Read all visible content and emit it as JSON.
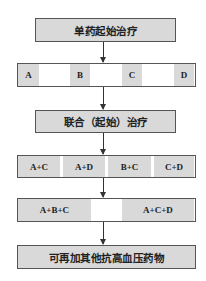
{
  "diagram": {
    "type": "flowchart",
    "direction": "top-to-bottom",
    "colors": {
      "box_fill": "#d9d9d9",
      "border": "#555555",
      "background": "#ffffff",
      "arrow": "#333333"
    },
    "nodes": [
      {
        "id": "mono",
        "label": "单药起始治疗"
      },
      {
        "id": "single-drugs",
        "cells": [
          "A",
          "B",
          "C",
          "D"
        ]
      },
      {
        "id": "combo",
        "label": "联合（起始）治疗"
      },
      {
        "id": "dual-drugs",
        "cells": [
          "A+C",
          "A+D",
          "B+C",
          "C+D"
        ]
      },
      {
        "id": "triple-drugs",
        "cells": [
          "A+B+C",
          "A+C+D"
        ]
      },
      {
        "id": "add-more",
        "label": "可再加其他抗高血压药物"
      }
    ],
    "edges": [
      [
        "mono",
        "single-drugs"
      ],
      [
        "single-drugs",
        "combo"
      ],
      [
        "combo",
        "dual-drugs"
      ],
      [
        "dual-drugs",
        "triple-drugs"
      ],
      [
        "triple-drugs",
        "add-more"
      ]
    ]
  }
}
